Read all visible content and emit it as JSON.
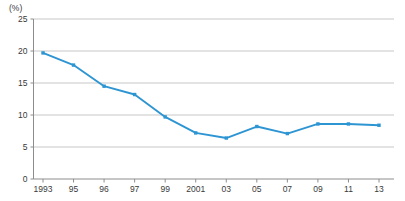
{
  "chart_data": {
    "type": "line",
    "title": "",
    "xlabel": "",
    "ylabel": "",
    "unit_label": "(%)",
    "categories": [
      "1993",
      "95",
      "96",
      "97",
      "99",
      "2001",
      "03",
      "05",
      "07",
      "09",
      "11",
      "13"
    ],
    "values": [
      19.7,
      17.8,
      14.5,
      13.2,
      9.7,
      7.2,
      6.4,
      8.2,
      7.1,
      8.6,
      8.6,
      8.4
    ],
    "series": [
      {
        "name": "",
        "values": [
          19.7,
          17.8,
          14.5,
          13.2,
          9.7,
          7.2,
          6.4,
          8.2,
          7.1,
          8.6,
          8.6,
          8.4
        ]
      }
    ],
    "ylim": [
      0,
      25
    ],
    "yticks": [
      0,
      5,
      10,
      15,
      20,
      25
    ],
    "ytick_labels": [
      "0",
      "5",
      "10",
      "15",
      "20",
      "25"
    ],
    "xtick_labels": [
      "1993",
      "95",
      "96",
      "97",
      "99",
      "2001",
      "03",
      "05",
      "07",
      "09",
      "11",
      "13"
    ],
    "grid": true,
    "grid_axis": "y",
    "legend": false,
    "legend_position": "none",
    "line_color": "#2e95d3",
    "marker_color": "#2e95d3",
    "grid_color": "#b9b9b9",
    "axis_color": "#8d8d8d",
    "text_color": "#3a3a3a",
    "background_color": "#ffffff"
  }
}
